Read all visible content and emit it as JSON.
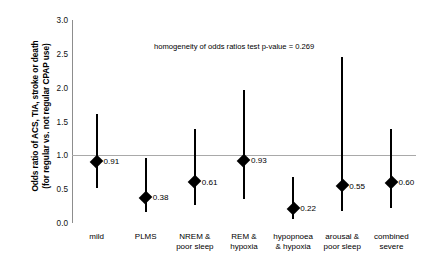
{
  "chart_data": {
    "type": "scatter",
    "title": "",
    "xlabel": "",
    "ylabel_line1": "Odds ratio of ACS, TIA, stroke or death",
    "ylabel_line2": "(for regular vs. not regular CPAP use)",
    "ylim": [
      0.0,
      3.0
    ],
    "yticks": [
      "3.0",
      "2.5",
      "2.0",
      "1.5",
      "1.0",
      "0.5",
      "0.0"
    ],
    "ytick_values": [
      3.0,
      2.5,
      2.0,
      1.5,
      1.0,
      0.5,
      0.0
    ],
    "reference_line": 1.0,
    "grid": false,
    "legend": "none",
    "annotation": "homogeneity of odds ratios test p-value = 0.269",
    "categories": [
      "mild",
      "PLMS",
      "NREM &\npoor sleep",
      "REM &\nhypoxia",
      "hypopnoea\n& hypoxia",
      "arousal &\npoor sleep",
      "combined\nsevere"
    ],
    "points": [
      {
        "category_line1": "mild",
        "category_line2": "",
        "odds_ratio": 0.91,
        "label": "0.91",
        "ci_low": 0.51,
        "ci_high": 1.61
      },
      {
        "category_line1": "PLMS",
        "category_line2": "",
        "odds_ratio": 0.38,
        "label": "0.38",
        "ci_low": 0.16,
        "ci_high": 0.96
      },
      {
        "category_line1": "NREM &",
        "category_line2": "poor sleep",
        "odds_ratio": 0.61,
        "label": "0.61",
        "ci_low": 0.26,
        "ci_high": 1.39
      },
      {
        "category_line1": "REM &",
        "category_line2": "hypoxia",
        "odds_ratio": 0.93,
        "label": "0.93",
        "ci_low": 0.35,
        "ci_high": 1.97
      },
      {
        "category_line1": "hypopnoea",
        "category_line2": "& hypoxia",
        "odds_ratio": 0.22,
        "label": "0.22",
        "ci_low": 0.06,
        "ci_high": 0.68
      },
      {
        "category_line1": "arousal &",
        "category_line2": "poor sleep",
        "odds_ratio": 0.55,
        "label": "0.55",
        "ci_low": 0.18,
        "ci_high": 2.46
      },
      {
        "category_line1": "combined",
        "category_line2": "severe",
        "odds_ratio": 0.6,
        "label": "0.60",
        "ci_low": 0.22,
        "ci_high": 1.39
      }
    ],
    "colors": {
      "marker": "#000000",
      "ci_bar": "#000000",
      "reference_line": "#a9a9a9",
      "axis": "#8d8d8d",
      "background": "#ffffff"
    }
  }
}
